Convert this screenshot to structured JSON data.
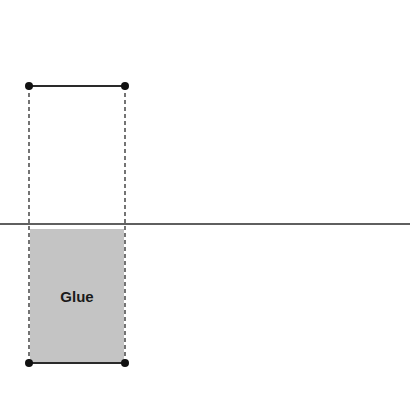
{
  "diagram": {
    "glue_label": "Glue",
    "colors": {
      "line": "#2a2a2a",
      "dot": "#111111",
      "glue_fill": "#c4c4c4",
      "background": "#ffffff"
    },
    "elements": {
      "top_bar": {
        "x1": 29,
        "x2": 125,
        "y": 86
      },
      "bottom_bar": {
        "x1": 29,
        "x2": 125,
        "y": 363
      },
      "dashed_guides": [
        {
          "x": 29
        },
        {
          "x": 125
        }
      ],
      "baseline": {
        "y": 224
      },
      "glue_block": {
        "x": 30,
        "y": 229,
        "width": 94,
        "height": 133
      }
    }
  }
}
